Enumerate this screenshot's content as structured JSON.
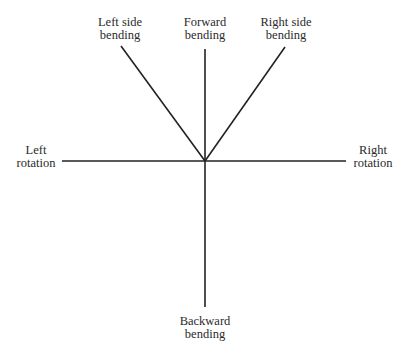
{
  "diagram": {
    "center": {
      "x": 205,
      "y": 161
    },
    "line_color": "#222222",
    "labels": {
      "left_side_bending": {
        "line1": "Left side",
        "line2": "bending"
      },
      "forward_bending": {
        "line1": "Forward",
        "line2": "bending"
      },
      "right_side_bending": {
        "line1": "Right side",
        "line2": "bending"
      },
      "left_rotation": {
        "line1": "Left",
        "line2": "rotation"
      },
      "right_rotation": {
        "line1": "Right",
        "line2": "rotation"
      },
      "backward_bending": {
        "line1": "Backward",
        "line2": "bending"
      }
    }
  }
}
